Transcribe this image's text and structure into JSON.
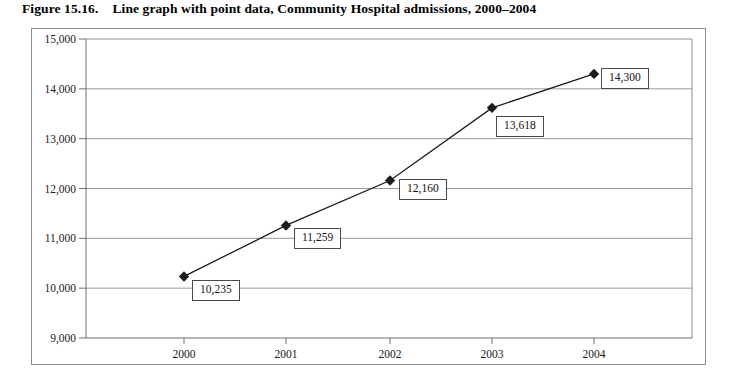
{
  "figure": {
    "number": "Figure 15.16.",
    "caption": "Line graph with point data, Community Hospital admissions, 2000–2004"
  },
  "chart_data": {
    "type": "line",
    "title": "Line graph with point data, Community Hospital admissions, 2000–2004",
    "xlabel": "",
    "ylabel": "",
    "categories": [
      "2000",
      "2001",
      "2002",
      "2003",
      "2004"
    ],
    "values": [
      10235,
      11259,
      12160,
      13618,
      14300
    ],
    "point_labels": [
      "10,235",
      "11,259",
      "12,160",
      "13,618",
      "14,300"
    ],
    "ylim": [
      9000,
      15000
    ],
    "ytick_values": [
      9000,
      10000,
      11000,
      12000,
      13000,
      14000,
      15000
    ],
    "ytick_labels": [
      "9,000",
      "10,000",
      "11,000",
      "12,000",
      "13,000",
      "14,000",
      "15,000"
    ],
    "xtick_labels": [
      "2000",
      "2001",
      "2002",
      "2003",
      "2004"
    ],
    "grid": "horizontal",
    "legend": "none",
    "marker": "diamond",
    "series_color": "#1c1c1c",
    "grid_color": "#9a9a9a",
    "axis_color": "#6e6e6e",
    "plot_background": "#ffffff"
  },
  "geometry": {
    "plot_left": 86,
    "plot_right": 692,
    "plot_top": 39,
    "plot_bottom": 338,
    "x_positions": [
      184,
      286,
      390,
      492,
      594
    ],
    "label_boxes": [
      {
        "left": 192,
        "top": 280
      },
      {
        "left": 294,
        "top": 228
      },
      {
        "left": 399,
        "top": 179
      },
      {
        "left": 496,
        "top": 116
      },
      {
        "left": 601,
        "top": 68
      }
    ]
  }
}
